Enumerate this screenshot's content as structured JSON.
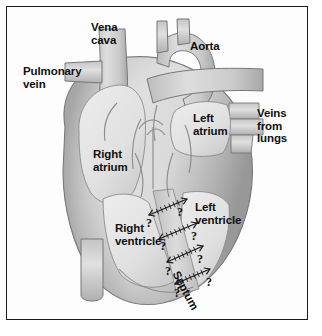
{
  "figure": {
    "kind": "anatomical-diagram",
    "frame_border_color": "#1b1b1b",
    "background_color": "#ffffff"
  },
  "palette": {
    "tissue_light": "#dcdcdc",
    "tissue_mid": "#c6c6c6",
    "tissue_dark": "#a9a9a9",
    "tissue_shadow": "#8f8f8f",
    "chamber_fill": "#e6e6e6",
    "outline": "#6e6e6e",
    "text": "#101010"
  },
  "labels": [
    {
      "id": "vena-cava",
      "text": "Vena\ncava",
      "x": 84,
      "y": 14
    },
    {
      "id": "aorta",
      "text": "Aorta",
      "x": 183,
      "y": 33
    },
    {
      "id": "pulmonary-vein",
      "text": "Pulmonary\nvein",
      "x": 16,
      "y": 58
    },
    {
      "id": "left-atrium",
      "text": "Left\natrium",
      "x": 186,
      "y": 105
    },
    {
      "id": "veins-from-lungs",
      "text": "Veins\nfrom\nlungs",
      "x": 250,
      "y": 100
    },
    {
      "id": "right-atrium",
      "text": "Right\natrium",
      "x": 86,
      "y": 141
    },
    {
      "id": "left-ventricle",
      "text": "Left\nventricle",
      "x": 188,
      "y": 194
    },
    {
      "id": "right-ventricle",
      "text": "Right\nventricle",
      "x": 108,
      "y": 215
    },
    {
      "id": "septum",
      "text": "Septum",
      "x": 174,
      "y": 262
    }
  ],
  "question_marks": [
    {
      "id": "q1",
      "x": 170,
      "y": 198
    },
    {
      "id": "q2",
      "x": 139,
      "y": 209
    },
    {
      "id": "q3",
      "x": 184,
      "y": 222
    },
    {
      "id": "q4",
      "x": 153,
      "y": 232
    },
    {
      "id": "q5",
      "x": 190,
      "y": 245
    },
    {
      "id": "q6",
      "x": 158,
      "y": 257
    },
    {
      "id": "q7",
      "x": 199,
      "y": 268
    },
    {
      "id": "q8",
      "x": 167,
      "y": 279
    }
  ],
  "septum_arrows": [
    {
      "id": "arrow-pair-1",
      "x1": 142,
      "y1": 208,
      "x2": 180,
      "y2": 192
    },
    {
      "id": "arrow-pair-2",
      "x1": 152,
      "y1": 232,
      "x2": 190,
      "y2": 216
    },
    {
      "id": "arrow-pair-3",
      "x1": 160,
      "y1": 255,
      "x2": 196,
      "y2": 239
    },
    {
      "id": "arrow-pair-4",
      "x1": 168,
      "y1": 277,
      "x2": 203,
      "y2": 262
    }
  ]
}
